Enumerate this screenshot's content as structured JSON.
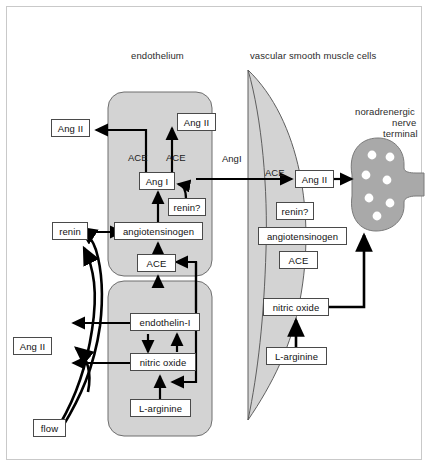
{
  "figure": {
    "background": "#ffffff",
    "frame_color": "#c9c9c9",
    "cell_fill": "#d3d3d3",
    "cell_stroke": "#6e6e6e",
    "nerve_fill": "#a9a9a9",
    "node_fill": "#ffffff",
    "node_stroke": "#4a4a4a",
    "arrow_color": "#000000"
  },
  "region_labels": {
    "endothelium": "endothelium",
    "smooth_muscle": "vascular smooth muscle cells",
    "nerve_terminal_line1": "noradrenergic",
    "nerve_terminal_line2": "nerve",
    "nerve_terminal_line3": "terminal"
  },
  "endothelium": {
    "upper_cell": {
      "ang_ii_out": "Ang II",
      "ang_ii_in": "Ang II",
      "ace_left": "ACE",
      "ace_right": "ACE",
      "ang_i": "Ang I",
      "renin_q": "renin?",
      "angiotensinogen": "angiotensinogen",
      "ace_lower": "ACE"
    },
    "lower_cell": {
      "endothelin": "endothelin-I",
      "nitric_oxide": "nitric oxide",
      "l_arginine": "L-arginine"
    }
  },
  "lumen": {
    "renin": "renin",
    "ang_ii": "Ang II",
    "flow": "flow"
  },
  "gap": {
    "ang_i_label": "AngI",
    "ace_label": "ACE"
  },
  "smooth_muscle": {
    "ang_ii": "Ang II",
    "renin_q": "renin?",
    "angiotensinogen": "angiotensinogen",
    "ace": "ACE",
    "nitric_oxide": "nitric oxide",
    "l_arginine": "L-arginine"
  },
  "nerve": {
    "vesicle_count": 6
  }
}
